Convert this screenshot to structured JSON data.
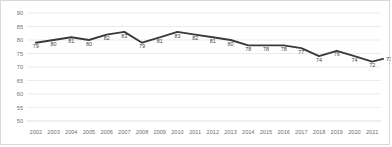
{
  "chart_data": {
    "type": "line",
    "title": "",
    "xlabel": "",
    "ylabel": "",
    "ylim": [
      50,
      90
    ],
    "y_ticks": [
      50,
      55,
      60,
      65,
      70,
      75,
      80,
      85,
      90
    ],
    "grid": true,
    "legend": "none",
    "line_color": "#3a3a3a",
    "categories": [
      "2002",
      "2003",
      "2004",
      "2005",
      "2006",
      "2007",
      "2008",
      "2009",
      "2010",
      "2011",
      "2012",
      "2013",
      "2014",
      "2015",
      "2016",
      "2017",
      "2018",
      "2019",
      "2020",
      "2021"
    ],
    "values": [
      79,
      80,
      81,
      80,
      82,
      83,
      79,
      81,
      83,
      82,
      81,
      80,
      78,
      78,
      78,
      77,
      74,
      76,
      74,
      72
    ],
    "point_labels": [
      "79",
      "80",
      "81",
      "80",
      "82",
      "83",
      "79",
      "81",
      "83",
      "82",
      "81",
      "80",
      "78",
      "78",
      "78",
      "77",
      "74",
      "76",
      "74",
      "72"
    ],
    "end_label": "73"
  },
  "axes": {
    "y_tick_labels": [
      "90",
      "85",
      "80",
      "75",
      "70",
      "65",
      "60",
      "55",
      "50"
    ],
    "x_tick_labels": [
      "2002",
      "2003",
      "2004",
      "2005",
      "2006",
      "2007",
      "2008",
      "2009",
      "2010",
      "2011",
      "2012",
      "2013",
      "2014",
      "2015",
      "2016",
      "2017",
      "2018",
      "2019",
      "2020",
      "2021"
    ]
  }
}
